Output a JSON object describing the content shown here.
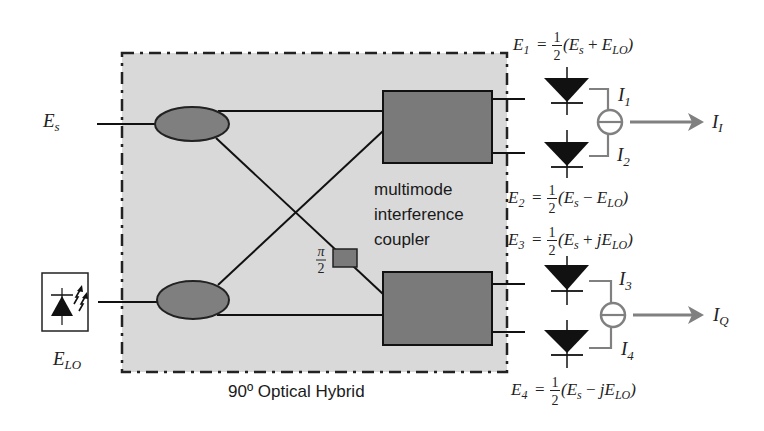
{
  "figure": {
    "caption": "90º Optical Hybrid",
    "coupler_label": [
      "multimode",
      "interference",
      "coupler"
    ]
  },
  "inputs": {
    "signal": {
      "symbol": "E",
      "sub": "s"
    },
    "local_oscillator": {
      "symbol": "E",
      "sub": "LO",
      "icon": "laser-diode-icon"
    }
  },
  "phase_shifter": {
    "num": "π",
    "den": "2"
  },
  "equations": [
    {
      "lhs": "E",
      "lhs_sub": "1",
      "eq": "=",
      "num": "1",
      "den": "2",
      "open": "(E",
      "s_sub": "s",
      "op": " + ",
      "var": "E",
      "lo_sub": "LO",
      "close": ")"
    },
    {
      "lhs": "E",
      "lhs_sub": "2",
      "eq": "=",
      "num": "1",
      "den": "2",
      "open": "(E",
      "s_sub": "s",
      "op": " − ",
      "var": "E",
      "lo_sub": "LO",
      "close": ")"
    },
    {
      "lhs": "E",
      "lhs_sub": "3",
      "eq": "=",
      "num": "1",
      "den": "2",
      "open": "(E",
      "s_sub": "s",
      "op": " + ",
      "var": "jE",
      "lo_sub": "LO",
      "close": ")"
    },
    {
      "lhs": "E",
      "lhs_sub": "4",
      "eq": "=",
      "num": "1",
      "den": "2",
      "open": "(E",
      "s_sub": "s",
      "op": " − ",
      "var": "jE",
      "lo_sub": "LO",
      "close": ")"
    }
  ],
  "currents": [
    {
      "symbol": "I",
      "sub": "1"
    },
    {
      "symbol": "I",
      "sub": "2"
    },
    {
      "symbol": "I",
      "sub": "3"
    },
    {
      "symbol": "I",
      "sub": "4"
    }
  ],
  "outputs": [
    {
      "symbol": "I",
      "sub": "I"
    },
    {
      "symbol": "I",
      "sub": "Q"
    }
  ],
  "colors": {
    "hybrid_background": "#d9d9d9",
    "splitter_fill": "#7f7f7f",
    "mmi_fill": "#7a7a7a",
    "arrow": "#808080",
    "diode": "#111111"
  }
}
